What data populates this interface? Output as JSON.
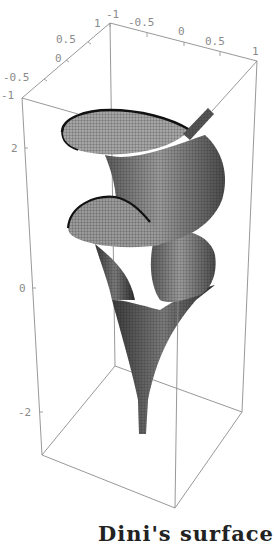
{
  "caption": "Dini's surface",
  "axes": {
    "x": {
      "ticks": [
        "-1",
        "-0.5",
        "0",
        "0.5",
        "1"
      ],
      "range": [
        -1,
        1
      ]
    },
    "y": {
      "ticks": [
        "1",
        "0.5",
        "0",
        "-0.5",
        "-1"
      ],
      "range": [
        -1,
        1
      ]
    },
    "z": {
      "ticks": [
        "2",
        "0",
        "-2"
      ],
      "range": [
        -3,
        3
      ]
    }
  },
  "surface": {
    "name": "Dini's surface",
    "turns": 2,
    "mesh_color": "#1a1a1a",
    "fill_color": "#8a8a8a"
  },
  "colors": {
    "box": "#8c8c8c",
    "labels": "#8a8a8a",
    "background": "#ffffff"
  }
}
